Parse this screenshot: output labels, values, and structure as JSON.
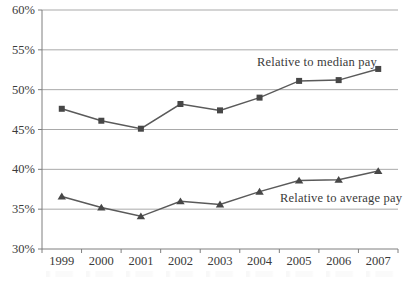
{
  "figure": {
    "background": "#ffffff",
    "width_px": 406,
    "height_px": 281
  },
  "chart_data": {
    "type": "line",
    "title": "",
    "xlabel": "",
    "ylabel": "",
    "categories": [
      "1999",
      "2000",
      "2001",
      "2002",
      "2003",
      "2004",
      "2005",
      "2006",
      "2007"
    ],
    "series": [
      {
        "name": "Relative to median pay",
        "marker": "square",
        "values": [
          47.6,
          46.1,
          45.1,
          48.2,
          47.4,
          49.0,
          51.1,
          51.2,
          52.6
        ]
      },
      {
        "name": "Relative to average pay",
        "marker": "triangle",
        "values": [
          36.6,
          35.2,
          34.1,
          36.0,
          35.6,
          37.2,
          38.6,
          38.7,
          39.8
        ]
      }
    ],
    "ylim": [
      30,
      60
    ],
    "ytick_step": 5,
    "ytick_labels": [
      "30%",
      "35%",
      "40%",
      "45%",
      "50%",
      "55%",
      "60%"
    ],
    "grid": "horizontal",
    "legend": "inline-annotations",
    "colors": {
      "line": "#5a5a5a",
      "marker": "#474747",
      "grid": "#a9a9a9",
      "axis": "#7e7e7e",
      "text": "#3a3a3a"
    }
  }
}
